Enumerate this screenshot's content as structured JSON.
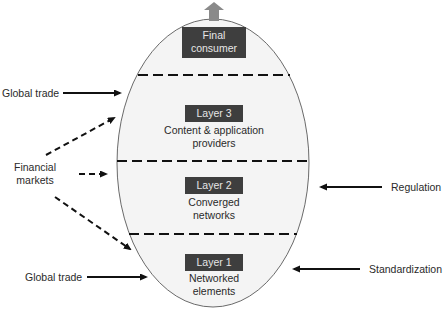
{
  "diagram": {
    "colors": {
      "ellipse_fill": "#f4f4f4",
      "ellipse_stroke": "#6a6a6a",
      "box_fill": "#3e3e3e",
      "box_text": "#e6e6e6",
      "up_arrow": "#8a8a8a",
      "arrow": "#111111"
    },
    "top_box": {
      "line1": "Final",
      "line2": "consumer",
      "icon": "up-arrow-icon"
    },
    "layers": [
      {
        "title": "Layer 3",
        "line1": "Content & application",
        "line2": "providers"
      },
      {
        "title": "Layer 2",
        "line1": "Converged",
        "line2": "networks"
      },
      {
        "title": "Layer 1",
        "line1": "Networked",
        "line2": "elements"
      }
    ],
    "left_inputs": {
      "global_trade_top": "Global trade",
      "financial_markets_line1": "Financial",
      "financial_markets_line2": "markets",
      "global_trade_bottom": "Global trade"
    },
    "right_inputs": {
      "regulation": "Regulation",
      "standardization": "Standardization"
    }
  }
}
